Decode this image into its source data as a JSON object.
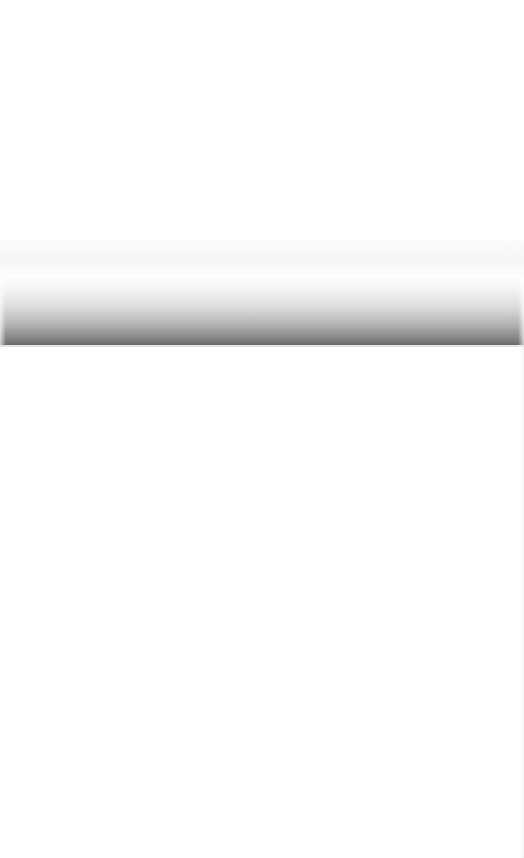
{
  "screen": {
    "state": "blank",
    "colors": {
      "background": "#ffffff",
      "band_light": "#f6f6f6",
      "shadow_dark": "#6a6a6a",
      "divider": "#e6e6e6"
    }
  }
}
